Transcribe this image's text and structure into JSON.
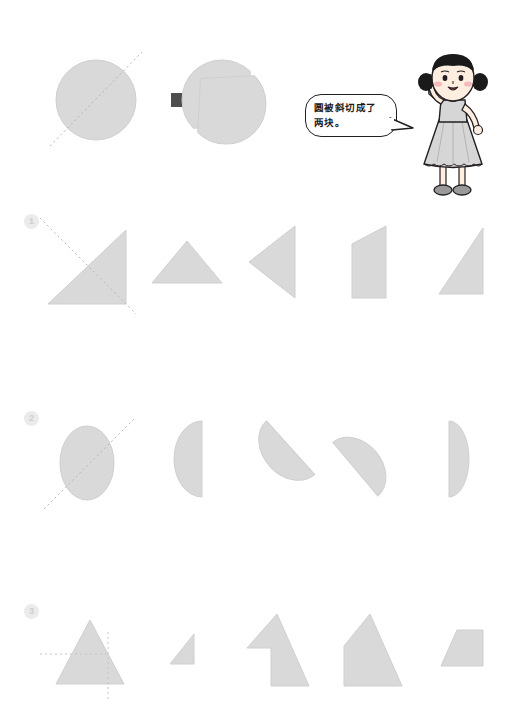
{
  "worksheet": {
    "title": "Cut shapes worksheet",
    "background_color": "#ffffff",
    "shape_fill": "#d9d9d9",
    "shape_stroke": "#c9c9c9",
    "cut_line_color": "#b9b9b9",
    "arrow_color": "#4d4d4d",
    "badge_bg": "#ebebeb",
    "badge_fg": "#cfcfcf"
  },
  "example": {
    "name": "circle-cut-example",
    "source_shape": "circle",
    "cut_line": "diagonal",
    "arrow": "right-arrow",
    "result_shapes": [
      "half-circle-upper-left",
      "half-circle-lower-right"
    ]
  },
  "speech": {
    "line1": "圆被斜切成了",
    "line2": "两块。",
    "full_text": "圆被斜切成了两块。"
  },
  "character": {
    "name": "girl-character",
    "description": "cartoon girl with pigtails",
    "hair_color": "#1a1a1a",
    "skin_color": "#fdeee0",
    "dress_color": "#d8d8d8",
    "cheek_color": "#f4b9bd"
  },
  "rows": [
    {
      "number": "1",
      "badge_label": "1",
      "prompt_shape": "right-triangle-cut-diagonal",
      "options": [
        {
          "label": "A",
          "shape": "triangle-up-wide"
        },
        {
          "label": "B",
          "shape": "triangle-left-pointing"
        },
        {
          "label": "C",
          "shape": "quadrilateral-tall-slanted"
        },
        {
          "label": "D",
          "shape": "right-triangle-slanted"
        }
      ]
    },
    {
      "number": "2",
      "badge_label": "2",
      "prompt_shape": "ellipse-cut-diagonal",
      "options": [
        {
          "label": "A",
          "shape": "half-ellipse-left"
        },
        {
          "label": "B",
          "shape": "half-ellipse-tilted-upper"
        },
        {
          "label": "C",
          "shape": "half-ellipse-tilted-lower"
        },
        {
          "label": "D",
          "shape": "half-ellipse-narrow-right"
        }
      ]
    },
    {
      "number": "3",
      "badge_label": "3",
      "prompt_shape": "triangle-with-cross-lines",
      "options": [
        {
          "label": "A",
          "shape": "small-right-triangle"
        },
        {
          "label": "B",
          "shape": "arrow-notched-triangle"
        },
        {
          "label": "C",
          "shape": "house-pentagon"
        },
        {
          "label": "D",
          "shape": "trapezoid"
        }
      ]
    }
  ]
}
